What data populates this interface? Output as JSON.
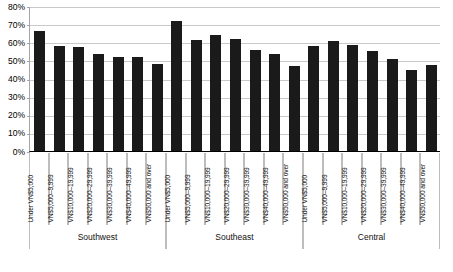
{
  "chart_data": {
    "type": "bar",
    "title": "",
    "xlabel": "",
    "ylabel": "",
    "ylim": [
      0,
      80
    ],
    "grid": true,
    "legend": null,
    "y_ticks": [
      "0%",
      "10%",
      "20%",
      "30%",
      "40%",
      "50%",
      "60%",
      "70%",
      "80%"
    ],
    "y_tick_values": [
      0,
      10,
      20,
      30,
      40,
      50,
      60,
      70,
      80
    ],
    "categories": [
      "Under VN$5,000",
      "VN$5,000–9,999",
      "VN$10,000–19,999",
      "VN$20,000–29,999",
      "VN$30,000–39,999",
      "VN$40,000–49,999",
      "VN$50,000 and over"
    ],
    "groups": [
      {
        "name": "Southwest",
        "values": [
          66,
          58,
          57.5,
          53.5,
          52,
          52,
          48
        ]
      },
      {
        "name": "Southeast",
        "values": [
          71.5,
          61.5,
          64,
          62,
          55.5,
          53.5,
          47
        ]
      },
      {
        "name": "Central",
        "values": [
          58,
          60.5,
          58.5,
          55,
          51,
          44.5,
          47.5
        ]
      }
    ],
    "bar_color": "#1a1a1a",
    "gridline_color": "#c9c9c9",
    "axis_color": "#000000",
    "background_color": "#ffffff"
  }
}
